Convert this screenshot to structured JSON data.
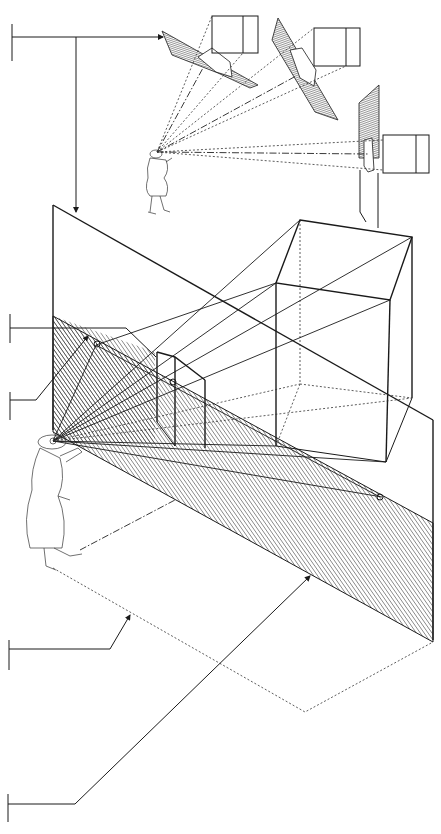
{
  "diagram": {
    "title": "",
    "colors": {
      "ink": "#1a1a1a",
      "background": "#ffffff",
      "hatch": "#2a2a2a"
    },
    "callouts": [
      {
        "id": "callout-1",
        "label": "",
        "target": "tilted-picture-planes-inset"
      },
      {
        "id": "callout-2",
        "label": "",
        "target": "picture-plane-top-edge"
      },
      {
        "id": "callout-3",
        "label": "",
        "target": "picture-plane-vanishing-point"
      },
      {
        "id": "callout-4",
        "label": "",
        "target": "ground-plane-station-line"
      },
      {
        "id": "callout-5",
        "label": "",
        "target": "picture-plane-base"
      }
    ],
    "figures": [
      {
        "id": "observer-main",
        "role": "viewer looking at picture plane"
      },
      {
        "id": "observer-inset",
        "role": "viewer in inset"
      }
    ],
    "objects": [
      {
        "id": "cube-main",
        "kind": "cube"
      },
      {
        "id": "cube-image",
        "kind": "projected cube on picture plane"
      },
      {
        "id": "inset-cube-1",
        "kind": "cube"
      },
      {
        "id": "inset-cube-2",
        "kind": "cube"
      },
      {
        "id": "inset-cube-3",
        "kind": "cube"
      }
    ]
  }
}
